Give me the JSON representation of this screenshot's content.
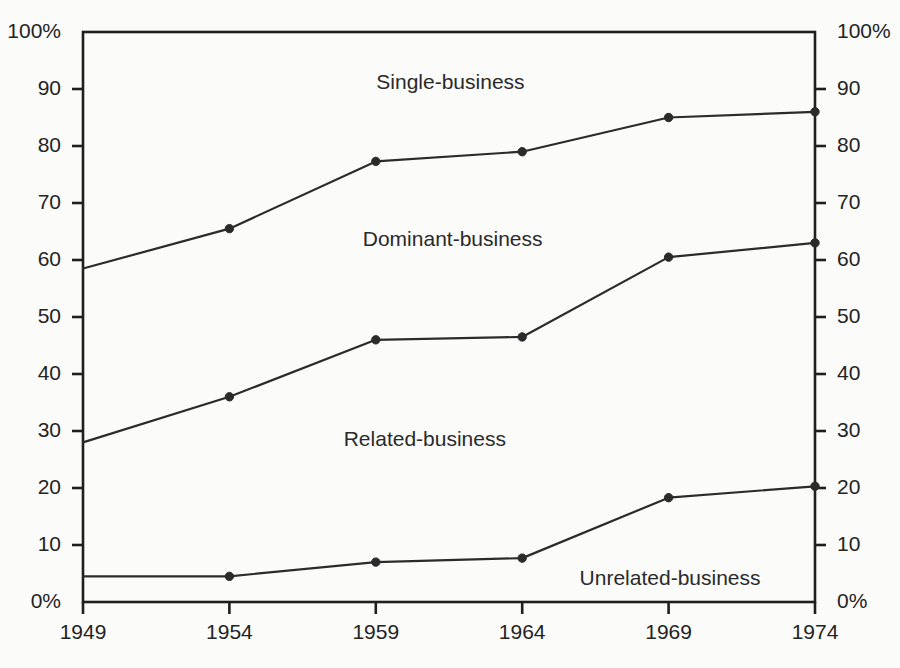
{
  "chart_data": {
    "type": "line",
    "title": "",
    "subtitle": "",
    "xlabel": "",
    "ylabel": "",
    "categories": [
      "1949",
      "1954",
      "1959",
      "1964",
      "1969",
      "1974"
    ],
    "x": [
      1949,
      1954,
      1959,
      1964,
      1969,
      1974
    ],
    "xlim": [
      1949,
      1974
    ],
    "ylim": [
      0,
      100
    ],
    "grid": false,
    "legend_position": "inline-annotations",
    "cumulative": true,
    "y_tick_values": [
      0,
      10,
      20,
      30,
      40,
      50,
      60,
      70,
      80,
      90,
      100
    ],
    "y_tick_labels_left": [
      "0%",
      "10",
      "20",
      "30",
      "40",
      "50",
      "60",
      "70",
      "80",
      "90",
      "100%"
    ],
    "y_tick_labels_right": [
      "0%",
      "10",
      "20",
      "30",
      "40",
      "50",
      "60",
      "70",
      "80",
      "90",
      "100%"
    ],
    "series": [
      {
        "name": "Related-business",
        "label": "Related-business",
        "values": [
          4.5,
          4.5,
          7.0,
          7.7,
          18.3,
          20.3
        ],
        "color": "#2b2b2b",
        "marker": "circle"
      },
      {
        "name": "Dominant-business",
        "label": "Dominant-business",
        "values": [
          28.0,
          36.0,
          46.0,
          46.5,
          60.5,
          63.0
        ],
        "color": "#2b2b2b",
        "marker": "circle"
      },
      {
        "name": "Single-business",
        "label": "Single-business",
        "values": [
          58.5,
          65.5,
          77.3,
          79.0,
          85.0,
          86.0
        ],
        "color": "#2b2b2b",
        "marker": "circle"
      }
    ],
    "band_labels": [
      {
        "text": "Single-business",
        "x_pct": 50.2,
        "y_pct": 91.0
      },
      {
        "text": "Dominant-business",
        "x_pct": 50.5,
        "y_pct": 63.5
      },
      {
        "text": "Related-business",
        "x_pct": 46.7,
        "y_pct": 28.5
      },
      {
        "text": "Unrelated-business",
        "x_pct": 80.2,
        "y_pct": 4.0
      }
    ]
  },
  "axis": {
    "left_labels": [
      "100%",
      "90",
      "80",
      "70",
      "60",
      "50",
      "40",
      "30",
      "20",
      "10",
      "0%"
    ],
    "right_labels": [
      "100%",
      "90",
      "80",
      "70",
      "60",
      "50",
      "40",
      "30",
      "20",
      "10",
      "0%"
    ],
    "x_labels": [
      "1949",
      "1954",
      "1959",
      "1964",
      "1969",
      "1974"
    ]
  },
  "style": {
    "line_color": "#2b2b2b",
    "axis_color": "#1f1f1f",
    "background": "#fbfbfa",
    "text_color": "#232323"
  },
  "labels": {
    "single": "Single-business",
    "dominant": "Dominant-business",
    "related": "Related-business",
    "unrelated": "Unrelated-business"
  }
}
